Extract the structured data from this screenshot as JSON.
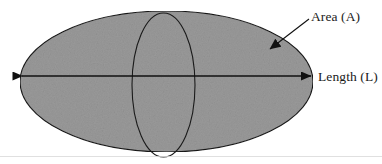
{
  "figure": {
    "type": "geometry-diagram",
    "background_color": "#ffffff",
    "shapes": {
      "outer_ellipse": {
        "name": "horizontal-ellipse",
        "center_x": 166.5,
        "center_y": 81.5,
        "radius_x": 146.5,
        "radius_y": 70.5,
        "fill_color": "#9a9a9a",
        "stroke_color": "#1a1a1a",
        "stroke_width": 1.1
      },
      "inner_ellipse": {
        "name": "vertical-ellipse",
        "center_x": 163.5,
        "center_y": 85,
        "radius_x": 31.5,
        "radius_y": 72,
        "fill_color": "none",
        "stroke_color": "#1a1a1a",
        "stroke_width": 1.1
      }
    },
    "arrows": {
      "length_arrow": {
        "name": "length-double-arrow",
        "x1": 20,
        "y1": 76,
        "x2": 313,
        "y2": 76,
        "double_headed": true,
        "color": "#111111"
      },
      "area_leader": {
        "name": "area-leader-arrow",
        "x1": 309,
        "y1": 19,
        "x2": 266,
        "y2": 52,
        "double_headed": false,
        "color": "#111111"
      }
    },
    "labels": {
      "area": "Area (A)",
      "length": "Length (L)"
    },
    "label_positions": {
      "area": {
        "x": 311,
        "y": 21
      },
      "length": {
        "x": 318,
        "y": 81
      }
    },
    "colors": {
      "fill_gray": "#9a9a9a",
      "ink": "#1a1a1a",
      "background": "#ffffff"
    }
  }
}
